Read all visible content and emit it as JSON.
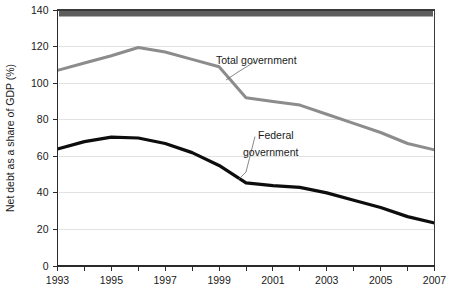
{
  "chart_data": {
    "type": "line",
    "title": "",
    "xlabel": "",
    "ylabel": "Net debt as a share of GDP (%)",
    "xlim": [
      1993,
      2007
    ],
    "ylim": [
      0,
      140
    ],
    "ytick_step": 20,
    "xtick_step": 1,
    "grid": "horizontal",
    "legend": "inline-annotations",
    "x": [
      1993,
      1994,
      1995,
      1996,
      1997,
      1998,
      1999,
      2000,
      2001,
      2002,
      2003,
      2004,
      2005,
      2006,
      2007
    ],
    "y_ticks": [
      0,
      20,
      40,
      60,
      80,
      100,
      120,
      140
    ],
    "y_tick_labels": [
      "0",
      "20",
      "40",
      "60",
      "80",
      "100",
      "120",
      "140"
    ],
    "x_tick_labels": [
      "1993",
      "",
      "1995",
      "",
      "1997",
      "",
      "1999",
      "",
      "2001",
      "",
      "2003",
      "",
      "2005",
      "",
      "2007"
    ],
    "x_labels_shown": [
      "1993",
      "1995",
      "1997",
      "1999",
      "2001",
      "2003",
      "2005",
      "2007"
    ],
    "series": [
      {
        "name": "Total government",
        "color": "#8c8c8c",
        "width": 3.0,
        "values": [
          107,
          111,
          115,
          119.5,
          117,
          113,
          109,
          92,
          90,
          88,
          83,
          78,
          73,
          67,
          63.5
        ]
      },
      {
        "name": "Federal government",
        "color": "#0d0d0d",
        "width": 3.2,
        "values": [
          64,
          68,
          70.5,
          70,
          67,
          62,
          55,
          45.5,
          44,
          43,
          40,
          36,
          32,
          27,
          23.5
        ]
      }
    ],
    "annotations": [
      {
        "text": "Total government",
        "x": 2000,
        "y": 126,
        "series": "Total government"
      },
      {
        "text": "Federal",
        "x": 2001.4,
        "y": 77,
        "series": "Federal government"
      },
      {
        "text": "government",
        "x": 2001.0,
        "y": 68,
        "series": "Federal government"
      }
    ]
  },
  "axis": {
    "ylabel": "Net debt as a share of GDP (%)",
    "y_labels": [
      "140",
      "120",
      "100",
      "80",
      "60",
      "40",
      "20",
      "0"
    ],
    "x_labels": [
      "1993",
      "1995",
      "1997",
      "1999",
      "2001",
      "2003",
      "2005",
      "2007"
    ]
  },
  "annotations": {
    "total": "Total government",
    "federal_line1": "Federal",
    "federal_line2": "government"
  },
  "colors": {
    "total_government": "#8c8c8c",
    "federal_government": "#0d0d0d",
    "grid": "#e2e2e2",
    "axis": "#2a2a2a",
    "background": "#ffffff",
    "top_band": "#5e5e5e"
  }
}
